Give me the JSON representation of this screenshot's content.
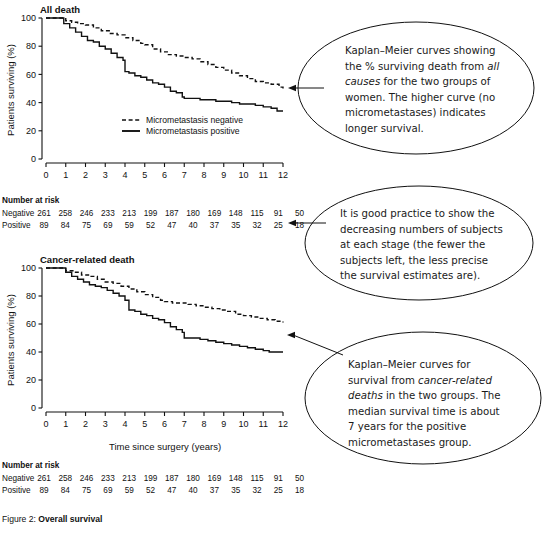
{
  "figure": {
    "caption_prefix": "Figure 2:",
    "caption_title": "Overall survival"
  },
  "panels": [
    {
      "id": "all-death",
      "title": "All death",
      "y_axis_label": "Patients surviving (%)",
      "x_axis_label": "",
      "y_ticks": [
        0,
        20,
        40,
        60,
        80,
        100
      ],
      "x_ticks": [
        0,
        1,
        2,
        3,
        4,
        5,
        6,
        7,
        8,
        9,
        10,
        11,
        12
      ],
      "legend": [
        {
          "label": "Micrometastasis negative",
          "style": "dashed"
        },
        {
          "label": "Micrometastasis positive",
          "style": "solid"
        }
      ],
      "risk_table": {
        "heading": "Number at risk",
        "rows": [
          {
            "label": "Negative",
            "values": [
              261,
              258,
              246,
              233,
              213,
              199,
              187,
              180,
              169,
              148,
              115,
              91,
              50
            ]
          },
          {
            "label": "Positive",
            "values": [
              89,
              84,
              75,
              69,
              59,
              52,
              47,
              40,
              37,
              35,
              32,
              25,
              18
            ]
          }
        ]
      }
    },
    {
      "id": "cancer-related-death",
      "title": "Cancer-related death",
      "y_axis_label": "Patients surviving (%)",
      "x_axis_label": "Time since surgery (years)",
      "y_ticks": [
        0,
        20,
        40,
        60,
        80,
        100
      ],
      "x_ticks": [
        0,
        1,
        2,
        3,
        4,
        5,
        6,
        7,
        8,
        9,
        10,
        11,
        12
      ],
      "legend": [],
      "risk_table": {
        "heading": "Number at risk",
        "rows": [
          {
            "label": "Negative",
            "values": [
              261,
              258,
              246,
              233,
              213,
              199,
              187,
              180,
              169,
              148,
              115,
              91,
              50
            ]
          },
          {
            "label": "Positive",
            "values": [
              89,
              84,
              75,
              69,
              59,
              52,
              47,
              40,
              37,
              35,
              32,
              25,
              18
            ]
          }
        ]
      }
    }
  ],
  "annotations": [
    {
      "id": "callout-all-death",
      "lines": [
        [
          {
            "t": "Kaplan–Meier curves showing",
            "i": false
          }
        ],
        [
          {
            "t": "the % surviving death from ",
            "i": false
          },
          {
            "t": "all",
            "i": true
          }
        ],
        [
          {
            "t": "causes",
            "i": true
          },
          {
            "t": " for the two groups of",
            "i": false
          }
        ],
        [
          {
            "t": "women. The higher curve (no",
            "i": false
          }
        ],
        [
          {
            "t": "micrometastases) indicates",
            "i": false
          }
        ],
        [
          {
            "t": "longer survival.",
            "i": false
          }
        ]
      ]
    },
    {
      "id": "callout-risk-table",
      "lines": [
        [
          {
            "t": "It is good practice to show the",
            "i": false
          }
        ],
        [
          {
            "t": "decreasing numbers of subjects",
            "i": false
          }
        ],
        [
          {
            "t": "at each stage (the fewer the",
            "i": false
          }
        ],
        [
          {
            "t": "subjects left, the less precise",
            "i": false
          }
        ],
        [
          {
            "t": "the survival estimates are).",
            "i": false
          }
        ]
      ]
    },
    {
      "id": "callout-cancer-death",
      "lines": [
        [
          {
            "t": "Kaplan–Meier curves for",
            "i": false
          }
        ],
        [
          {
            "t": "survival from ",
            "i": false
          },
          {
            "t": "cancer-related",
            "i": true
          }
        ],
        [
          {
            "t": "deaths",
            "i": true
          },
          {
            "t": " in the two groups. The",
            "i": false
          }
        ],
        [
          {
            "t": "median survival time is about",
            "i": false
          }
        ],
        [
          {
            "t": "7 years for the positive",
            "i": false
          }
        ],
        [
          {
            "t": "micrometastases group.",
            "i": false
          }
        ]
      ]
    }
  ],
  "chart_data": [
    {
      "type": "line",
      "title": "All death",
      "xlabel": "Time since surgery (years)",
      "ylabel": "Patients surviving (%)",
      "xlim": [
        0,
        12
      ],
      "ylim": [
        0,
        100
      ],
      "xticks": [
        0,
        1,
        2,
        3,
        4,
        5,
        6,
        7,
        8,
        9,
        10,
        11,
        12
      ],
      "yticks": [
        0,
        20,
        40,
        60,
        80,
        100
      ],
      "grid": false,
      "legend_position": "lower-center",
      "series": [
        {
          "name": "Micrometastasis negative",
          "style": "dashed",
          "x": [
            0.0,
            0.6,
            1.0,
            1.3,
            1.6,
            2.0,
            2.4,
            2.8,
            3.2,
            3.6,
            4.0,
            4.4,
            4.8,
            5.0,
            5.4,
            5.8,
            6.2,
            6.6,
            7.0,
            7.4,
            7.8,
            8.2,
            8.6,
            9.0,
            9.4,
            9.8,
            10.2,
            10.6,
            11.0,
            11.4,
            11.8,
            12.0
          ],
          "y": [
            100,
            100,
            98,
            97,
            96,
            95,
            93,
            91,
            89,
            88,
            86,
            84,
            82,
            81,
            78,
            76,
            74,
            73,
            72,
            71,
            69,
            67,
            65,
            63,
            61,
            59,
            57,
            55,
            54,
            53,
            51,
            50
          ]
        },
        {
          "name": "Micrometastasis positive",
          "style": "solid",
          "x": [
            0.0,
            0.6,
            0.9,
            1.2,
            1.5,
            1.8,
            2.1,
            2.4,
            2.7,
            3.0,
            3.3,
            3.6,
            3.9,
            4.0,
            4.2,
            4.5,
            4.8,
            5.1,
            5.4,
            5.7,
            6.0,
            6.3,
            6.6,
            6.9,
            7.0,
            7.4,
            7.8,
            8.2,
            8.6,
            9.0,
            9.4,
            9.8,
            10.2,
            10.6,
            11.0,
            11.4,
            11.7,
            12.0
          ],
          "y": [
            100,
            100,
            96,
            93,
            90,
            87,
            84,
            83,
            80,
            78,
            75,
            72,
            70,
            62,
            61,
            59,
            58,
            56,
            54,
            53,
            51,
            48,
            47,
            44,
            43,
            43,
            42,
            42,
            41,
            41,
            40,
            39,
            39,
            38,
            37,
            36,
            34,
            34
          ]
        }
      ],
      "risk_table": {
        "heading": "Number at risk",
        "x": [
          0,
          1,
          2,
          3,
          4,
          5,
          6,
          7,
          8,
          9,
          10,
          11,
          12
        ],
        "rows": [
          {
            "label": "Negative",
            "values": [
              261,
              258,
              246,
              233,
              213,
              199,
              187,
              180,
              169,
              148,
              115,
              91,
              50
            ]
          },
          {
            "label": "Positive",
            "values": [
              89,
              84,
              75,
              69,
              59,
              52,
              47,
              40,
              37,
              35,
              32,
              25,
              18
            ]
          }
        ]
      }
    },
    {
      "type": "line",
      "title": "Cancer-related death",
      "xlabel": "Time since surgery (years)",
      "ylabel": "Patients surviving (%)",
      "xlim": [
        0,
        12
      ],
      "ylim": [
        0,
        100
      ],
      "xticks": [
        0,
        1,
        2,
        3,
        4,
        5,
        6,
        7,
        8,
        9,
        10,
        11,
        12
      ],
      "yticks": [
        0,
        20,
        40,
        60,
        80,
        100
      ],
      "grid": false,
      "legend_position": "none",
      "series": [
        {
          "name": "Micrometastasis negative",
          "style": "dashed",
          "x": [
            0.0,
            0.7,
            1.0,
            1.4,
            1.8,
            2.2,
            2.6,
            3.0,
            3.4,
            3.8,
            4.2,
            4.6,
            5.0,
            5.4,
            5.8,
            6.0,
            6.4,
            6.8,
            7.2,
            7.6,
            8.0,
            8.4,
            8.8,
            9.2,
            9.6,
            10.0,
            10.4,
            10.8,
            11.2,
            11.6,
            12.0
          ],
          "y": [
            100,
            100,
            98,
            97,
            95,
            94,
            92,
            90,
            89,
            87,
            85,
            83,
            81,
            79,
            77,
            76,
            75,
            75,
            74,
            73,
            72,
            71,
            70,
            69,
            67,
            66,
            65,
            64,
            63,
            62,
            61
          ]
        },
        {
          "name": "Micrometastasis positive",
          "style": "solid",
          "x": [
            0.0,
            0.7,
            1.0,
            1.3,
            1.6,
            1.9,
            2.2,
            2.5,
            2.8,
            3.1,
            3.4,
            3.7,
            4.0,
            4.2,
            4.5,
            4.8,
            5.1,
            5.4,
            5.7,
            6.0,
            6.3,
            6.6,
            6.9,
            7.0,
            7.4,
            7.8,
            8.2,
            8.6,
            9.0,
            9.4,
            9.8,
            10.2,
            10.6,
            11.0,
            11.3,
            11.6,
            12.0
          ],
          "y": [
            100,
            100,
            97,
            94,
            92,
            90,
            88,
            87,
            86,
            84,
            82,
            80,
            77,
            70,
            69,
            67,
            66,
            64,
            63,
            61,
            58,
            56,
            54,
            50,
            50,
            49,
            48,
            47,
            46,
            45,
            44,
            43,
            42,
            41,
            40,
            40,
            40
          ]
        }
      ],
      "risk_table": {
        "heading": "Number at risk",
        "x": [
          0,
          1,
          2,
          3,
          4,
          5,
          6,
          7,
          8,
          9,
          10,
          11,
          12
        ],
        "rows": [
          {
            "label": "Negative",
            "values": [
              261,
              258,
              246,
              233,
              213,
              199,
              187,
              180,
              169,
              148,
              115,
              91,
              50
            ]
          },
          {
            "label": "Positive",
            "values": [
              89,
              84,
              75,
              69,
              59,
              52,
              47,
              40,
              37,
              35,
              32,
              25,
              18
            ]
          }
        ]
      }
    }
  ]
}
